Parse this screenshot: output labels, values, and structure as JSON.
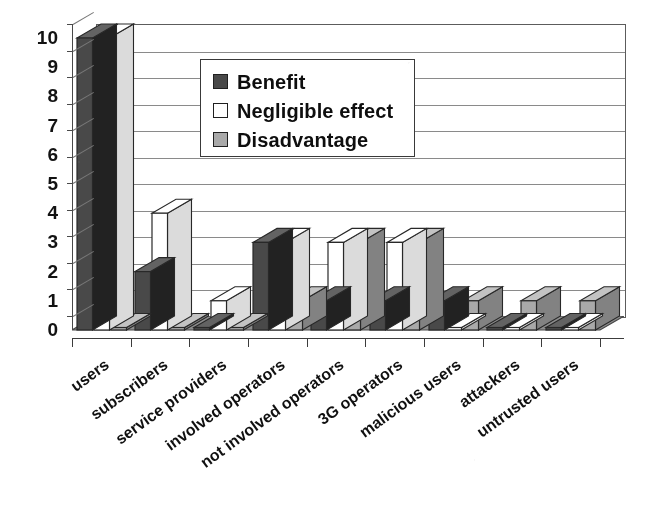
{
  "chart_data": {
    "type": "bar",
    "title": "",
    "subtitle": "",
    "xlabel": "",
    "ylabel": "",
    "grid": true,
    "legend_position": "inside-top-left",
    "orientation": "vertical-grouped-3d",
    "ylim": [
      0,
      10
    ],
    "ytick_step": 1,
    "ytick_labels": [
      "10",
      "9",
      "8",
      "7",
      "6",
      "5",
      "4",
      "3",
      "2",
      "1",
      "0"
    ],
    "categories": [
      "users",
      "subscribers",
      "service providers",
      "involved operators",
      "not involved operators",
      "3G operators",
      "malicious users",
      "attackers",
      "untrusted users"
    ],
    "series": [
      {
        "name": "Benefit",
        "color": "#4a4a4a",
        "values": [
          10,
          2,
          0,
          3,
          1,
          1,
          1,
          0,
          0
        ]
      },
      {
        "name": "Negligible effect",
        "color": "#ffffff",
        "values": [
          10,
          4,
          1,
          3,
          3,
          3,
          0,
          0,
          0
        ]
      },
      {
        "name": "Disadvantage",
        "color": "#a8a8a8",
        "values": [
          0,
          0,
          0,
          1,
          3,
          3,
          1,
          1,
          1
        ]
      }
    ]
  },
  "legend": {
    "items": [
      {
        "label": "Benefit"
      },
      {
        "label": "Negligible effect"
      },
      {
        "label": "Disadvantage"
      }
    ]
  },
  "ghost_text": {
    "line1": "",
    "line2": "",
    "line3": ""
  }
}
